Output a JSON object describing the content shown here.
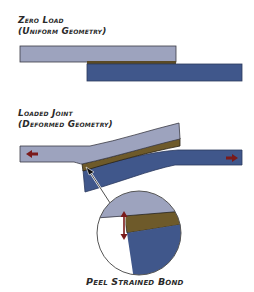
{
  "panels": {
    "zero_load": {
      "title_line1": "Zero Load",
      "title_line2": "(Uniform Geometry)"
    },
    "loaded_joint": {
      "title_line1": "Loaded Joint",
      "title_line2": "(Deformed Geometry)"
    },
    "detail": {
      "caption": "Peel Strained Bond"
    }
  },
  "colors": {
    "upper_adherend": "#9da3be",
    "lower_adherend": "#40578b",
    "adhesive": "#6e5a2a",
    "load_arrow": "#7a1a1a",
    "outline": "#3a3a44"
  },
  "icons": {
    "left_load_arrow": "arrow-left",
    "right_load_arrow": "arrow-right",
    "peel_arrow": "double-arrow-vertical",
    "callout_arrow": "pointer-arrow"
  }
}
